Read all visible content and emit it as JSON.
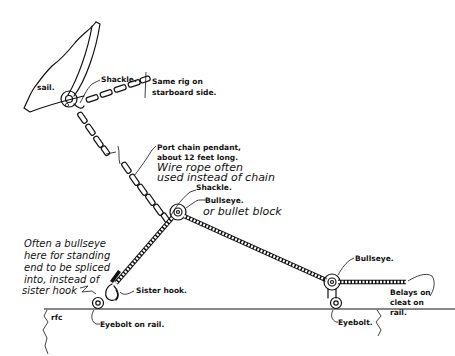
{
  "diagram": {
    "type": "rigging line drawing",
    "labels": {
      "sail": "sail.",
      "shackle_top": "Shackle.",
      "same_rig_1": "Same rig on",
      "same_rig_2": "starboard side.",
      "port_pendant_1": "Port chain pendant,",
      "port_pendant_2": "about 12 feet long.",
      "wire_rope_1": "Wire rope often",
      "wire_rope_2": "used instead of chain",
      "shackle_mid": "Shackle.",
      "bullseye_mid_1": "Bullseye.",
      "bullseye_mid_2": "or bullet block",
      "often_1": "Often a bullseye",
      "often_2": "here for standing",
      "often_3": "end to be spliced",
      "often_4": "into, instead of",
      "often_5": "sister hook",
      "sister_hook": "Sister hook.",
      "rfc": "rfc",
      "eyebolt_rail": "Eyebolt on rail.",
      "bullseye_right": "Bullseye.",
      "belays_1": "Belays on",
      "belays_2": "cleat on",
      "belays_3": "rail.",
      "eyebolt_right": "Eyebolt."
    },
    "components": [
      "sail",
      "shackle",
      "chain pendant",
      "bullseye",
      "wire rope",
      "sister hook",
      "eyebolt",
      "rail"
    ]
  }
}
